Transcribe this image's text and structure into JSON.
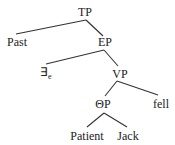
{
  "diagram": {
    "type": "syntax-tree",
    "colors": {
      "line": "#333333",
      "text": "#222222",
      "background": "#ffffff"
    },
    "nodes": {
      "tp": {
        "label": "TP"
      },
      "past": {
        "label": "Past"
      },
      "ep": {
        "label": "EP"
      },
      "exists": {
        "label": "∃",
        "subscript": "e"
      },
      "vp": {
        "label": "VP"
      },
      "theta_p": {
        "label": "ΘP"
      },
      "fell": {
        "label": "fell"
      },
      "patient": {
        "label": "Patient"
      },
      "jack": {
        "label": "Jack"
      }
    },
    "edges": [
      [
        "TP",
        "Past"
      ],
      [
        "TP",
        "EP"
      ],
      [
        "EP",
        "∃e"
      ],
      [
        "EP",
        "VP"
      ],
      [
        "VP",
        "ΘP"
      ],
      [
        "VP",
        "fell"
      ],
      [
        "ΘP",
        "Patient"
      ],
      [
        "ΘP",
        "Jack"
      ]
    ]
  }
}
